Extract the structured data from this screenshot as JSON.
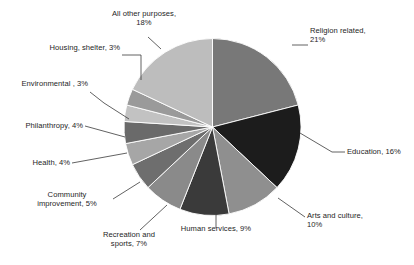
{
  "chart_data": {
    "type": "pie",
    "title": "",
    "subtitle": "",
    "xlabel": "",
    "ylabel": "",
    "legend_position": "none",
    "grid": false,
    "units": "percent",
    "total": 100,
    "start_angle_deg": 0,
    "direction": "clockwise",
    "categories": [
      "Religion related",
      "Education",
      "Arts and culture",
      "Human services",
      "Recreation and sports",
      "Community improvement",
      "Health",
      "Philanthropy",
      "Environmental ",
      "Housing, shelter",
      "All other purposes"
    ],
    "values": [
      21,
      16,
      10,
      9,
      7,
      5,
      4,
      4,
      3,
      3,
      18
    ],
    "colors": [
      "#787878",
      "#1c1c1c",
      "#8f8f8f",
      "#3a3a3a",
      "#8a8a8a",
      "#6e6e6e",
      "#a6a6a6",
      "#6a6a6a",
      "#c2c2c2",
      "#9a9a9a",
      "#bdbdbd"
    ],
    "labels": [
      {
        "text": "Religion related,\n21%",
        "value": 21,
        "percent_text": "21%"
      },
      {
        "text": "Education, 16%",
        "value": 16,
        "percent_text": "16%"
      },
      {
        "text": "Arts and culture,\n10%",
        "value": 10,
        "percent_text": "10%"
      },
      {
        "text": "Human services, 9%",
        "value": 9,
        "percent_text": "9%"
      },
      {
        "text": "Recreation and\nsports, 7%",
        "value": 7,
        "percent_text": "7%"
      },
      {
        "text": "Community\nimprovement, 5%",
        "value": 5,
        "percent_text": "5%"
      },
      {
        "text": "Health, 4%",
        "value": 4,
        "percent_text": "4%"
      },
      {
        "text": "Philanthropy, 4%",
        "value": 4,
        "percent_text": "4%"
      },
      {
        "text": "Environmental , 3%",
        "value": 3,
        "percent_text": "3%"
      },
      {
        "text": "Housing, shelter, 3%",
        "value": 3,
        "percent_text": "3%"
      },
      {
        "text": "All other purposes,\n18%",
        "value": 18,
        "percent_text": "18%"
      }
    ]
  },
  "labels": {
    "religion": "Religion related,\n21%",
    "education": "Education, 16%",
    "arts": "Arts and culture,\n10%",
    "human_services": "Human services, 9%",
    "recreation": "Recreation and\nsports, 7%",
    "community": "Community\nimprovement, 5%",
    "health": "Health, 4%",
    "philanthropy": "Philanthropy, 4%",
    "environmental": "Environmental , 3%",
    "housing": "Housing, shelter, 3%",
    "all_other": "All other purposes,\n18%"
  },
  "colors": {
    "background": "#ffffff",
    "text": "#1e1e1e",
    "leader_line": "#3a3a3a",
    "slice_border": "#ffffff"
  }
}
